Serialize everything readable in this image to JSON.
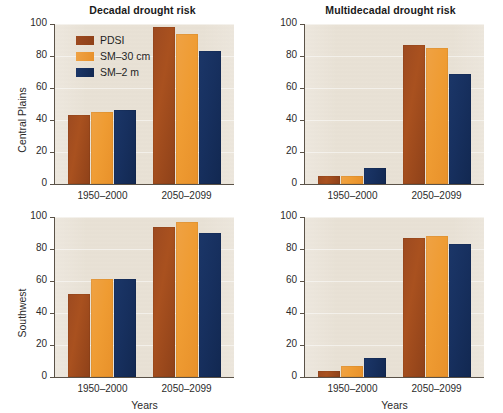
{
  "chart_data": {
    "type": "bar",
    "title": "",
    "xlabel": "Years",
    "categories": [
      "1950–2000",
      "2050–2099"
    ],
    "ylim": [
      0,
      100
    ],
    "yticks": [
      0,
      20,
      40,
      60,
      80,
      100
    ],
    "grid": true,
    "legend_position": "top-left-of-first-panel",
    "legend": [
      "PDSI",
      "SM–30 cm",
      "SM–2 m"
    ],
    "colors": {
      "PDSI": "#9d4a20",
      "SM–30 cm": "#ef9c33",
      "SM–2 m": "#17305f",
      "plot_background": "#e9e2d6",
      "axis": "#5a5248"
    },
    "panels": [
      {
        "id": "central-plains-decadal",
        "column_title": "Decadal drought risk",
        "row_label": "Central Plains",
        "series": [
          {
            "name": "PDSI",
            "values": [
              43,
              98
            ]
          },
          {
            "name": "SM–30 cm",
            "values": [
              45,
              94
            ]
          },
          {
            "name": "SM–2 m",
            "values": [
              46,
              83
            ]
          }
        ]
      },
      {
        "id": "central-plains-multidecadal",
        "column_title": "Multidecadal drought risk",
        "row_label": "Central Plains",
        "series": [
          {
            "name": "PDSI",
            "values": [
              5,
              87
            ]
          },
          {
            "name": "SM–30 cm",
            "values": [
              5,
              85
            ]
          },
          {
            "name": "SM–2 m",
            "values": [
              10,
              69
            ]
          }
        ]
      },
      {
        "id": "southwest-decadal",
        "column_title": "Decadal drought risk",
        "row_label": "Southwest",
        "series": [
          {
            "name": "PDSI",
            "values": [
              52,
              94
            ]
          },
          {
            "name": "SM–30 cm",
            "values": [
              61,
              97
            ]
          },
          {
            "name": "SM–2 m",
            "values": [
              61,
              90
            ]
          }
        ]
      },
      {
        "id": "southwest-multidecadal",
        "column_title": "Multidecadal drought risk",
        "row_label": "Southwest",
        "series": [
          {
            "name": "PDSI",
            "values": [
              4,
              87
            ]
          },
          {
            "name": "SM–30 cm",
            "values": [
              7,
              88
            ]
          },
          {
            "name": "SM–2 m",
            "values": [
              12,
              83
            ]
          }
        ]
      }
    ]
  },
  "titles": {
    "left_column": "Decadal drought risk",
    "right_column": "Multidecadal drought risk"
  },
  "row_labels": {
    "top": "Central Plains",
    "bottom": "Southwest"
  },
  "axis": {
    "xlabel": "Years",
    "yticks": [
      "0",
      "20",
      "40",
      "60",
      "80",
      "100"
    ],
    "xticks": [
      "1950–2000",
      "2050–2099"
    ]
  },
  "legend": {
    "items": [
      {
        "label": "PDSI",
        "key": "pdsi"
      },
      {
        "label": "SM–30 cm",
        "key": "sm30"
      },
      {
        "label": "SM–2 m",
        "key": "sm2"
      }
    ]
  }
}
